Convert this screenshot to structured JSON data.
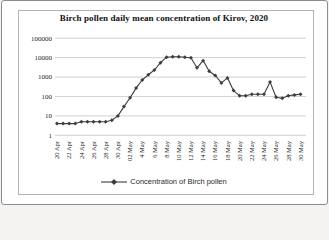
{
  "window": {
    "background": "#fefefe",
    "photo_border_color": "#8c8c8c",
    "frame_border_color": "#b3b3b3"
  },
  "chart_data": {
    "type": "line",
    "title": "Birch pollen daily mean concentration of Kirov, 2020",
    "scale_y": "log",
    "ylim": [
      1,
      100000
    ],
    "y_ticks": [
      100000,
      10000,
      1000,
      100,
      10,
      1
    ],
    "grid": true,
    "legend_position": "bottom",
    "x_tick_labels": [
      "20 Apr",
      "22 Apr",
      "24 Apr",
      "26 Apr",
      "28 Apr",
      "30 Apr",
      "02 May",
      "4 May",
      "6 May",
      "8 May",
      "10 May",
      "12 May",
      "14 May",
      "16 May",
      "18 May",
      "20 May",
      "22 May",
      "24 May",
      "26 May",
      "28 May",
      "30 May"
    ],
    "series": [
      {
        "name": "Concentration of Birch pollen",
        "marker": "diamond",
        "color": "#3d3d3d",
        "x": [
          "20 Apr",
          "21 Apr",
          "22 Apr",
          "23 Apr",
          "24 Apr",
          "25 Apr",
          "26 Apr",
          "27 Apr",
          "28 Apr",
          "29 Apr",
          "30 Apr",
          "1 May",
          "2 May",
          "3 May",
          "4 May",
          "5 May",
          "6 May",
          "7 May",
          "8 May",
          "9 May",
          "10 May",
          "11 May",
          "12 May",
          "13 May",
          "14 May",
          "15 May",
          "16 May",
          "17 May",
          "18 May",
          "19 May",
          "20 May",
          "21 May",
          "22 May",
          "23 May",
          "24 May",
          "25 May",
          "26 May",
          "27 May",
          "28 May",
          "29 May",
          "30 May"
        ],
        "values": [
          4,
          4,
          4,
          4,
          5,
          5,
          5,
          5,
          5,
          6,
          10,
          30,
          85,
          270,
          700,
          1300,
          2300,
          5500,
          10500,
          11000,
          11000,
          10500,
          9800,
          3000,
          7000,
          2000,
          1200,
          500,
          900,
          200,
          110,
          110,
          130,
          130,
          130,
          550,
          90,
          80,
          110,
          120,
          130
        ]
      }
    ],
    "style": {
      "grid_color": "#bdbdbd",
      "text_color": "#1c1c1c"
    }
  },
  "legend": {
    "marker_icon": "line-diamond",
    "label": "Concentration of Birch pollen"
  }
}
